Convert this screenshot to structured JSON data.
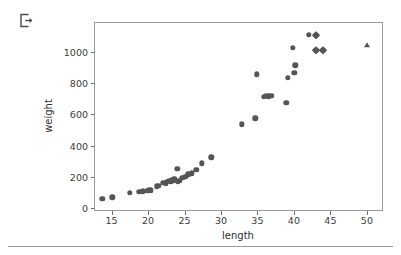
{
  "toolbar": {
    "export_icon": "export-icon"
  },
  "figure": {
    "width": 401,
    "height": 255,
    "marker_color": "#555555",
    "frame_color": "#9a9a9a"
  },
  "chart_data": {
    "type": "scatter",
    "title": "",
    "xlabel": "length",
    "ylabel": "weight",
    "xlim": [
      12.6,
      52.3
    ],
    "ylim": [
      -55,
      1175
    ],
    "xticks": [
      15,
      20,
      25,
      30,
      35,
      40,
      45,
      50
    ],
    "yticks": [
      0,
      200,
      400,
      600,
      800,
      1000
    ],
    "xticklabels": [
      "15",
      "20",
      "25",
      "30",
      "35",
      "40",
      "45",
      "50"
    ],
    "yticklabels": [
      "0",
      "200",
      "400",
      "600",
      "800",
      "1000"
    ],
    "grid": false,
    "legend": null,
    "series": [
      {
        "name": "circles",
        "marker": "circle",
        "color": "#555555",
        "points": [
          [
            13.6,
            32
          ],
          [
            15.0,
            40
          ],
          [
            17.4,
            69
          ],
          [
            18.7,
            78
          ],
          [
            19.2,
            80
          ],
          [
            19.7,
            82
          ],
          [
            20.0,
            85
          ],
          [
            20.3,
            86
          ],
          [
            21.1,
            113
          ],
          [
            21.4,
            115
          ],
          [
            22.0,
            135
          ],
          [
            22.3,
            130
          ],
          [
            22.5,
            143
          ],
          [
            22.8,
            150
          ],
          [
            23.0,
            145
          ],
          [
            23.2,
            152
          ],
          [
            23.4,
            148
          ],
          [
            23.5,
            160
          ],
          [
            23.6,
            155
          ],
          [
            23.9,
            225
          ],
          [
            24.0,
            140
          ],
          [
            24.2,
            148
          ],
          [
            24.6,
            168
          ],
          [
            25.0,
            175
          ],
          [
            25.4,
            190
          ],
          [
            25.9,
            196
          ],
          [
            26.5,
            220
          ],
          [
            27.3,
            262
          ],
          [
            28.6,
            302
          ],
          [
            32.8,
            515
          ],
          [
            34.6,
            556
          ],
          [
            34.8,
            840
          ],
          [
            35.8,
            695
          ],
          [
            36.1,
            700
          ],
          [
            36.4,
            698
          ],
          [
            36.8,
            700
          ],
          [
            38.9,
            655
          ],
          [
            39.1,
            820
          ],
          [
            39.8,
            1015
          ],
          [
            40.0,
            850
          ],
          [
            40.1,
            900
          ],
          [
            42.0,
            1100
          ]
        ]
      },
      {
        "name": "diamonds",
        "marker": "diamond",
        "color": "#555555",
        "points": [
          [
            42.9,
            1100
          ],
          [
            42.9,
            1000
          ],
          [
            43.9,
            1000
          ]
        ]
      },
      {
        "name": "triangle",
        "marker": "triangle",
        "color": "#555555",
        "points": [
          [
            49.9,
            1030
          ]
        ]
      }
    ]
  }
}
